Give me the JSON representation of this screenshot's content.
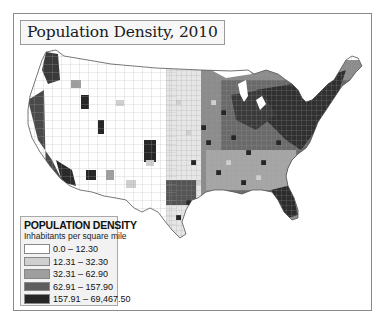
{
  "title": "Population Density, 2010",
  "legend": {
    "title": "POPULATION DENSITY",
    "subtitle": "Inhabitants per square mile",
    "classes": [
      {
        "label": "0.0 – 12.30",
        "color": "#ffffff"
      },
      {
        "label": "12.31 – 32.30",
        "color": "#cfcfcf"
      },
      {
        "label": "32.31 – 62.90",
        "color": "#9e9e9e"
      },
      {
        "label": "62.91 – 157.90",
        "color": "#5e5e5e"
      },
      {
        "label": "157.91 – 69,467.50",
        "color": "#262626"
      }
    ]
  },
  "map": {
    "region": "Contiguous United States",
    "unit": "counties",
    "style": "grayscale choropleth"
  }
}
